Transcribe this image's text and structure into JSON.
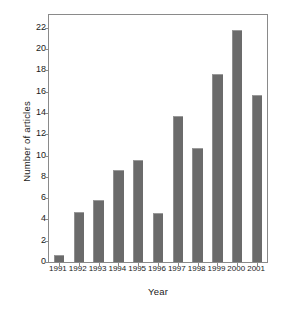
{
  "chart_data": {
    "type": "bar",
    "title": "",
    "xlabel": "Year",
    "ylabel": "Number of articles",
    "categories": [
      "1991",
      "1992",
      "1993",
      "1994",
      "1995",
      "1996",
      "1997",
      "1998",
      "1999",
      "2000",
      "2001"
    ],
    "values": [
      0.7,
      4.7,
      5.8,
      8.6,
      9.6,
      4.6,
      13.7,
      10.7,
      17.7,
      21.8,
      15.7
    ],
    "ylim": [
      0,
      23.2
    ],
    "yticks": [
      0,
      2,
      4,
      6,
      8,
      10,
      12,
      14,
      16,
      18,
      20,
      22
    ],
    "ytick_labels": [
      "0",
      "2",
      "4",
      "6",
      "8",
      "10",
      "12",
      "14",
      "16",
      "18",
      "20",
      "22"
    ],
    "grid": false,
    "legend": false,
    "legend_position": "none",
    "bar_color": "#6b6b6b",
    "frame_color": "#8a8a8a",
    "background_color": "#ffffff"
  }
}
